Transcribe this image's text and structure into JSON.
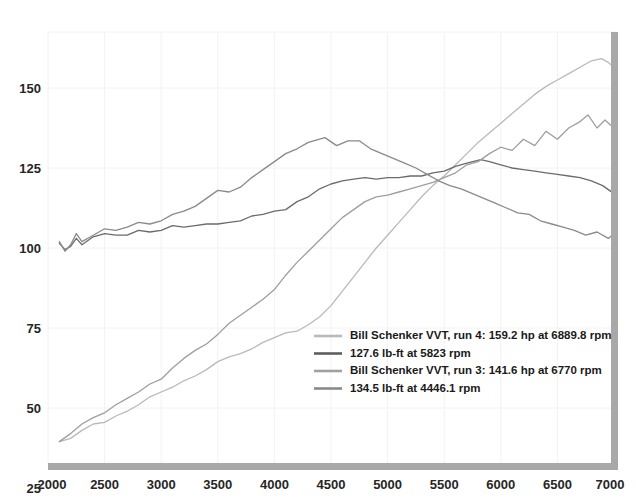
{
  "chart_data": {
    "type": "line",
    "title": "",
    "xlabel": "",
    "ylabel": "",
    "xlim": [
      2000,
      7000
    ],
    "ylim": [
      25,
      162
    ],
    "grid": true,
    "legend_position": "inside-bottom-center",
    "x_ticks": [
      "2000",
      "2500",
      "3000",
      "3500",
      "4000",
      "4500",
      "5000",
      "5500",
      "6000",
      "6500",
      "7000"
    ],
    "y_ticks": [
      "25",
      "50",
      "75",
      "100",
      "125",
      "150"
    ],
    "series": [
      {
        "name": "Bill Schenker VVT, run 4: 159.2 hp at 6889.8 rpm",
        "key": "run4_hp",
        "color": "#b9b9b9",
        "width": 1.3,
        "peak_value": 159.2,
        "peak_rpm": 6889.8,
        "units": "hp",
        "x": [
          2100,
          2200,
          2300,
          2400,
          2500,
          2600,
          2700,
          2800,
          2900,
          3000,
          3100,
          3200,
          3300,
          3400,
          3500,
          3600,
          3700,
          3800,
          3900,
          4000,
          4100,
          4200,
          4300,
          4400,
          4500,
          4600,
          4700,
          4800,
          4900,
          5000,
          5100,
          5200,
          5300,
          5400,
          5500,
          5600,
          5700,
          5800,
          5900,
          6000,
          6100,
          6200,
          6300,
          6400,
          6500,
          6600,
          6700,
          6800,
          6890,
          6950,
          7000
        ],
        "y": [
          39.5,
          40.5,
          43.0,
          45.0,
          45.5,
          47.5,
          49.0,
          51.0,
          53.5,
          55.0,
          56.5,
          58.5,
          60.0,
          62.0,
          64.5,
          66.0,
          67.0,
          68.5,
          70.5,
          72.0,
          73.5,
          74.0,
          76.0,
          78.5,
          82.0,
          86.5,
          91.0,
          95.5,
          100.0,
          104.0,
          108.0,
          112.0,
          116.0,
          119.5,
          122.5,
          126.0,
          129.5,
          133.0,
          136.0,
          139.0,
          142.0,
          145.0,
          148.0,
          150.5,
          152.5,
          154.5,
          156.5,
          158.5,
          159.2,
          158.0,
          156.5
        ]
      },
      {
        "name": "127.6 lb-ft at 5823 rpm",
        "key": "run4_torque",
        "color": "#6b6b6b",
        "width": 1.3,
        "peak_value": 127.6,
        "peak_rpm": 5823,
        "units": "lb-ft",
        "x": [
          2100,
          2150,
          2200,
          2250,
          2300,
          2400,
          2500,
          2600,
          2700,
          2800,
          2900,
          3000,
          3100,
          3200,
          3300,
          3400,
          3500,
          3600,
          3700,
          3800,
          3900,
          4000,
          4100,
          4200,
          4300,
          4400,
          4500,
          4600,
          4700,
          4800,
          4900,
          5000,
          5100,
          5200,
          5300,
          5400,
          5500,
          5600,
          5700,
          5823,
          5900,
          6000,
          6100,
          6200,
          6300,
          6400,
          6500,
          6600,
          6700,
          6800,
          6900,
          7000
        ],
        "y": [
          101.5,
          99.5,
          100.5,
          103.0,
          101.0,
          103.5,
          104.5,
          104.0,
          104.0,
          105.5,
          105.0,
          105.5,
          107.0,
          106.5,
          107.0,
          107.5,
          107.5,
          108.0,
          108.5,
          110.0,
          110.5,
          111.5,
          112.0,
          114.5,
          116.0,
          118.5,
          120.0,
          121.0,
          121.5,
          122.0,
          121.5,
          122.0,
          122.0,
          122.5,
          122.5,
          123.5,
          124.0,
          125.5,
          126.5,
          127.6,
          127.0,
          126.0,
          125.0,
          124.5,
          124.0,
          123.5,
          123.0,
          122.5,
          122.0,
          121.0,
          119.5,
          117.0
        ]
      },
      {
        "name": "Bill Schenker VVT, run 3: 141.6 hp at 6770 rpm",
        "key": "run3_hp",
        "color": "#9e9e9e",
        "width": 1.3,
        "peak_value": 141.6,
        "peak_rpm": 6770,
        "units": "hp",
        "x": [
          2100,
          2200,
          2300,
          2400,
          2500,
          2600,
          2700,
          2800,
          2900,
          3000,
          3100,
          3200,
          3300,
          3400,
          3500,
          3600,
          3700,
          3800,
          3900,
          4000,
          4100,
          4200,
          4300,
          4400,
          4500,
          4600,
          4700,
          4800,
          4900,
          5000,
          5100,
          5200,
          5300,
          5400,
          5500,
          5600,
          5700,
          5800,
          5900,
          6000,
          6100,
          6200,
          6300,
          6400,
          6500,
          6600,
          6700,
          6770,
          6850,
          6920,
          7000
        ],
        "y": [
          39.5,
          42.0,
          45.0,
          47.0,
          48.5,
          51.0,
          53.0,
          55.0,
          57.5,
          59.0,
          62.5,
          65.5,
          68.0,
          70.0,
          73.0,
          76.5,
          79.0,
          81.5,
          84.0,
          87.0,
          91.5,
          95.5,
          99.0,
          102.5,
          106.0,
          109.5,
          112.0,
          114.5,
          116.0,
          116.5,
          117.5,
          118.5,
          119.5,
          120.5,
          122.0,
          123.5,
          126.0,
          127.0,
          129.5,
          131.5,
          130.5,
          134.0,
          132.0,
          136.5,
          134.0,
          137.5,
          139.5,
          141.6,
          137.5,
          140.0,
          137.5
        ]
      },
      {
        "name": "134.5 lb-ft at 4446.1 rpm",
        "key": "run3_torque",
        "color": "#8a8a8a",
        "width": 1.3,
        "peak_value": 134.5,
        "peak_rpm": 4446.1,
        "units": "lb-ft",
        "x": [
          2100,
          2150,
          2200,
          2250,
          2300,
          2400,
          2500,
          2600,
          2700,
          2800,
          2900,
          3000,
          3100,
          3200,
          3300,
          3400,
          3500,
          3600,
          3700,
          3800,
          3900,
          4000,
          4100,
          4200,
          4300,
          4446,
          4550,
          4650,
          4750,
          4850,
          4950,
          5050,
          5150,
          5250,
          5350,
          5450,
          5550,
          5650,
          5750,
          5850,
          5950,
          6050,
          6150,
          6250,
          6350,
          6450,
          6550,
          6650,
          6750,
          6850,
          6950,
          7000
        ],
        "y": [
          102.0,
          99.0,
          101.0,
          104.5,
          102.0,
          104.0,
          106.0,
          105.5,
          106.5,
          108.0,
          107.5,
          108.5,
          110.5,
          111.5,
          113.0,
          115.5,
          118.0,
          117.5,
          119.0,
          122.0,
          124.5,
          127.0,
          129.5,
          131.0,
          133.0,
          134.5,
          132.0,
          133.5,
          133.5,
          131.0,
          129.5,
          128.0,
          126.5,
          125.0,
          123.0,
          121.0,
          119.5,
          118.5,
          117.0,
          115.5,
          114.0,
          112.5,
          111.0,
          110.5,
          108.5,
          107.5,
          106.5,
          105.5,
          104.0,
          105.0,
          103.0,
          104.5
        ]
      }
    ],
    "legend": [
      {
        "label": "Bill Schenker VVT, run 4: 159.2 hp at 6889.8 rpm",
        "color": "#b9b9b9"
      },
      {
        "label": "127.6 lb-ft at 5823 rpm",
        "color": "#5e5e5e"
      },
      {
        "label": "Bill Schenker VVT, run 3: 141.6 hp at 6770 rpm",
        "color": "#a0a0a0"
      },
      {
        "label": "134.5 lb-ft at 4446.1 rpm",
        "color": "#8a8a8a"
      }
    ],
    "axis_color": "#a8a8a8",
    "grid_color": "#f2f2f2"
  }
}
